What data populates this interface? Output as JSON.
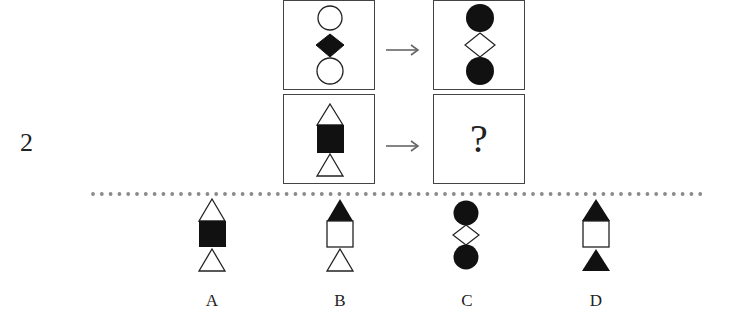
{
  "question": {
    "number": "2",
    "example_pair": {
      "source": [
        "white-circle",
        "black-diamond",
        "white-circle"
      ],
      "target": [
        "black-circle",
        "white-diamond",
        "black-circle"
      ]
    },
    "query_pair": {
      "source": [
        "white-triangle",
        "black-square",
        "white-triangle"
      ],
      "target_placeholder": "?"
    },
    "arrow_icon": "right-arrow"
  },
  "options": [
    {
      "label": "A",
      "shapes": [
        "white-triangle",
        "black-square",
        "white-triangle"
      ]
    },
    {
      "label": "B",
      "shapes": [
        "black-triangle",
        "white-square",
        "white-triangle"
      ]
    },
    {
      "label": "C",
      "shapes": [
        "black-circle",
        "white-diamond",
        "black-circle"
      ]
    },
    {
      "label": "D",
      "shapes": [
        "black-triangle",
        "white-square",
        "black-triangle"
      ]
    }
  ],
  "colors": {
    "fill_black": "#111111",
    "stroke": "#222222",
    "divider_dots": "#8a8a8a",
    "box_border": "#444444"
  }
}
